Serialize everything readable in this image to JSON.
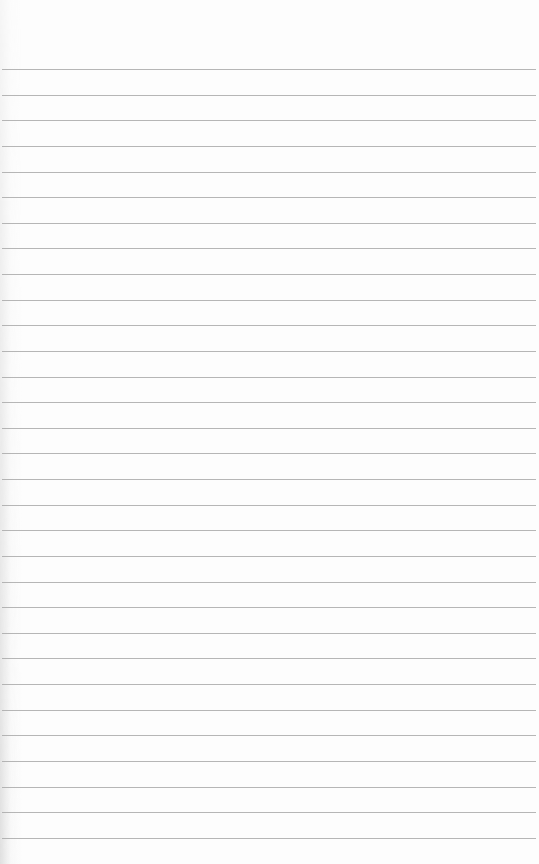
{
  "paper": {
    "type": "ruled-lined-paper",
    "background_color": "#fdfdfd",
    "line_color": "#a9a9a9",
    "line_count": 31,
    "first_line_y": 69,
    "line_spacing": 25.63,
    "line_right_edge": 536
  }
}
